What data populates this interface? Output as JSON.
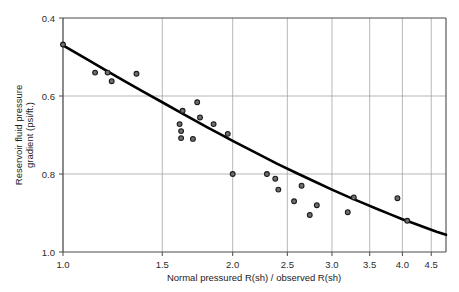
{
  "chart_data": {
    "type": "scatter",
    "title": "",
    "xlabel": "Normal pressured R(sh) / observed R(sh)",
    "ylabel": "Reservoir fluid pressure gradient (psi/ft.)",
    "xscale": "log",
    "xlim": [
      1.0,
      4.78
    ],
    "ylim": [
      0.4,
      1.0
    ],
    "y_inverted": true,
    "grid": true,
    "legend": "none",
    "xticks": [
      1.0,
      1.5,
      2.0,
      2.5,
      3.0,
      3.5,
      4.0,
      4.5
    ],
    "xtick_labels": [
      "1.0",
      "1.5",
      "2.0",
      "2.5",
      "3.0",
      "3.5",
      "4.0",
      "4.5"
    ],
    "yticks": [
      0.4,
      0.6,
      0.8,
      1.0
    ],
    "ytick_labels": [
      "0.4",
      "0.6",
      "0.8",
      "1.0"
    ],
    "scatter_points": [
      {
        "x": 1.0,
        "y": 0.468
      },
      {
        "x": 1.14,
        "y": 0.54
      },
      {
        "x": 1.2,
        "y": 0.54
      },
      {
        "x": 1.22,
        "y": 0.562
      },
      {
        "x": 1.35,
        "y": 0.543
      },
      {
        "x": 1.61,
        "y": 0.672
      },
      {
        "x": 1.62,
        "y": 0.69
      },
      {
        "x": 1.62,
        "y": 0.708
      },
      {
        "x": 1.63,
        "y": 0.638
      },
      {
        "x": 1.7,
        "y": 0.71
      },
      {
        "x": 1.73,
        "y": 0.616
      },
      {
        "x": 1.75,
        "y": 0.655
      },
      {
        "x": 1.85,
        "y": 0.672
      },
      {
        "x": 1.96,
        "y": 0.697
      },
      {
        "x": 2.0,
        "y": 0.8
      },
      {
        "x": 2.3,
        "y": 0.8
      },
      {
        "x": 2.38,
        "y": 0.812
      },
      {
        "x": 2.41,
        "y": 0.84
      },
      {
        "x": 2.57,
        "y": 0.87
      },
      {
        "x": 2.65,
        "y": 0.83
      },
      {
        "x": 2.74,
        "y": 0.905
      },
      {
        "x": 2.82,
        "y": 0.88
      },
      {
        "x": 3.2,
        "y": 0.898
      },
      {
        "x": 3.28,
        "y": 0.86
      },
      {
        "x": 3.92,
        "y": 0.862
      },
      {
        "x": 4.08,
        "y": 0.92
      }
    ],
    "fit_curve": [
      {
        "x": 1.0,
        "y": 0.47
      },
      {
        "x": 1.1,
        "y": 0.505
      },
      {
        "x": 1.2,
        "y": 0.537
      },
      {
        "x": 1.3,
        "y": 0.566
      },
      {
        "x": 1.4,
        "y": 0.592
      },
      {
        "x": 1.5,
        "y": 0.616
      },
      {
        "x": 1.6,
        "y": 0.639
      },
      {
        "x": 1.7,
        "y": 0.66
      },
      {
        "x": 1.8,
        "y": 0.68
      },
      {
        "x": 1.9,
        "y": 0.698
      },
      {
        "x": 2.0,
        "y": 0.715
      },
      {
        "x": 2.2,
        "y": 0.746
      },
      {
        "x": 2.4,
        "y": 0.774
      },
      {
        "x": 2.6,
        "y": 0.798
      },
      {
        "x": 2.8,
        "y": 0.82
      },
      {
        "x": 3.0,
        "y": 0.84
      },
      {
        "x": 3.2,
        "y": 0.858
      },
      {
        "x": 3.4,
        "y": 0.874
      },
      {
        "x": 3.6,
        "y": 0.889
      },
      {
        "x": 3.8,
        "y": 0.903
      },
      {
        "x": 4.0,
        "y": 0.916
      },
      {
        "x": 4.2,
        "y": 0.927
      },
      {
        "x": 4.4,
        "y": 0.938
      },
      {
        "x": 4.6,
        "y": 0.948
      },
      {
        "x": 4.78,
        "y": 0.956
      }
    ]
  }
}
